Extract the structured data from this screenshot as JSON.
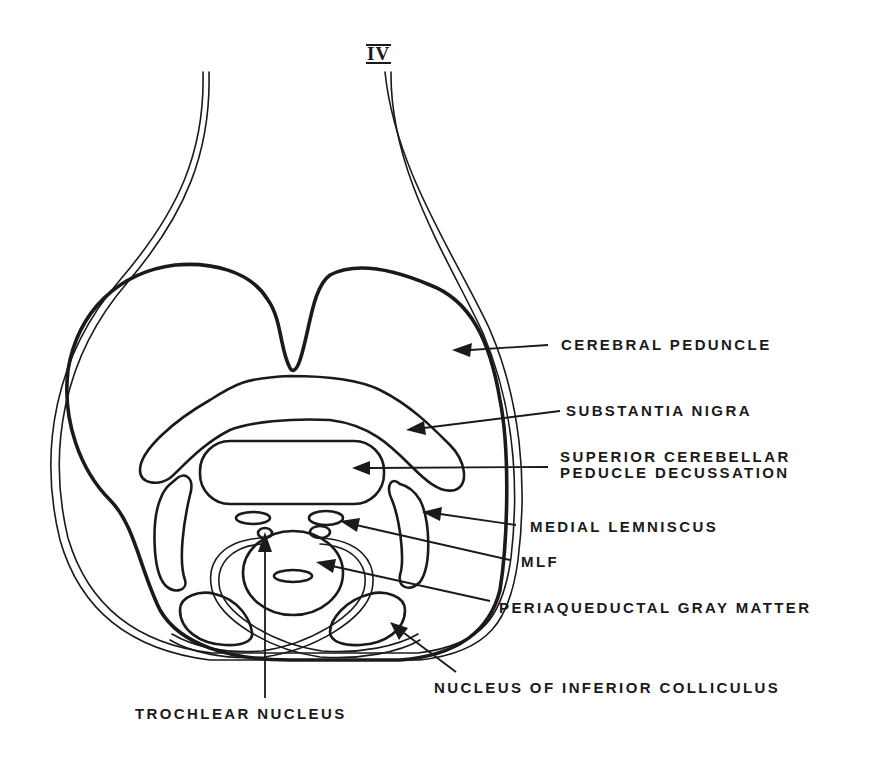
{
  "diagram": {
    "title": "IV",
    "labels": [
      {
        "id": "cerebral-peduncle",
        "text": "CEREBRAL PEDUNCLE"
      },
      {
        "id": "substantia-nigra",
        "text": "SUBSTANTIA NIGRA"
      },
      {
        "id": "scp-decussation-line1",
        "text": "SUPERIOR CEREBELLAR"
      },
      {
        "id": "scp-decussation-line2",
        "text": "PEDUCLE DECUSSATION"
      },
      {
        "id": "medial-lemniscus",
        "text": "MEDIAL LEMNISCUS"
      },
      {
        "id": "mlf",
        "text": "MLF"
      },
      {
        "id": "periaqueductal-gray",
        "text": "PERIAQUEDUCTAL GRAY MATTER"
      },
      {
        "id": "inferior-colliculus",
        "text": "NUCLEUS OF INFERIOR COLLICULUS"
      },
      {
        "id": "trochlear-nucleus",
        "text": "TROCHLEAR NUCLEUS"
      }
    ],
    "colors": {
      "ink": "#1a1a1a",
      "background": "#ffffff"
    }
  }
}
